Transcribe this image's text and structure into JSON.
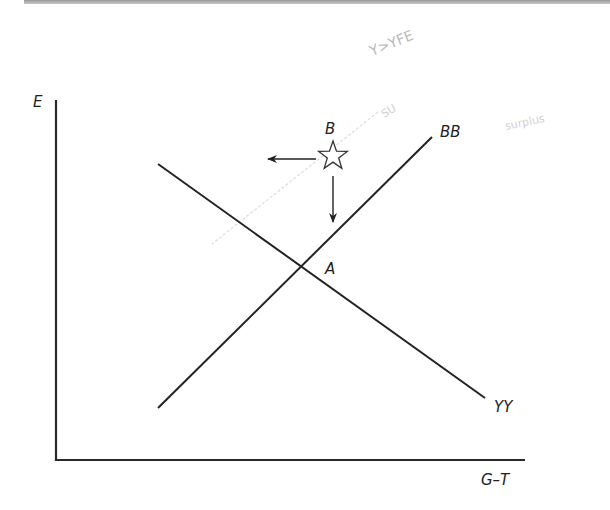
{
  "diagram": {
    "type": "economics-equilibrium-diagram",
    "axes": {
      "y_label": "E",
      "x_label": "G–T"
    },
    "curves": [
      {
        "name": "BB",
        "label": "BB",
        "slope": "upward"
      },
      {
        "name": "YY",
        "label": "YY",
        "slope": "downward"
      }
    ],
    "points": [
      {
        "name": "A",
        "label": "A",
        "description": "intersection of BB and YY"
      },
      {
        "name": "B",
        "label": "B",
        "marker": "star",
        "description": "point above BB and YY"
      }
    ],
    "arrows": [
      {
        "from": "B",
        "direction": "left"
      },
      {
        "from": "B",
        "direction": "down"
      }
    ],
    "handwritten_annotations": [
      {
        "text": "Y>YFE",
        "position": "top-right"
      },
      {
        "text": "SU",
        "position": "upper-right of B"
      },
      {
        "text": "surplus",
        "position": "far right, faint"
      }
    ],
    "colors": {
      "line": "#222222",
      "pencil": "#b8b8b8",
      "background": "#ffffff"
    }
  }
}
